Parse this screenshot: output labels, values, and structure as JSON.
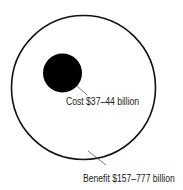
{
  "diagram": {
    "type": "proportional-area-circles",
    "colors": {
      "background": "#ffffff",
      "outline": "#111111",
      "cost_fill": "#000000",
      "text": "#222222",
      "leader": "#555555"
    },
    "benefit": {
      "label": "Benefit $157–777 billion",
      "circle": {
        "cx": 83.5,
        "cy": 87.5,
        "r": 72
      }
    },
    "cost": {
      "label": "Cost $37–44 billion",
      "circle": {
        "cx": 62.5,
        "cy": 73,
        "r": 19.5
      }
    }
  }
}
